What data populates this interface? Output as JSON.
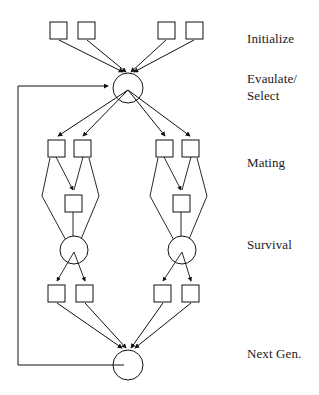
{
  "diagram": {
    "type": "flow-diagram",
    "background_color": "#ffffff",
    "stroke_color": "#111111",
    "node_fill": "#ffffff",
    "stage_labels": [
      {
        "id": "initialize",
        "text": "Initialize",
        "x": 247,
        "y": 30
      },
      {
        "id": "evaluate-select",
        "text": "Evaulate/",
        "x": 247,
        "y": 77
      },
      {
        "id": "evaluate-select-line2",
        "text": "Select",
        "x": 247,
        "y": 94
      },
      {
        "id": "mating",
        "text": "Mating",
        "x": 247,
        "y": 161
      },
      {
        "id": "survival",
        "text": "Survival",
        "x": 247,
        "y": 243
      },
      {
        "id": "next-gen",
        "text": "Next Gen.",
        "x": 247,
        "y": 352
      }
    ],
    "nodes": {
      "initialize_squares": [
        {
          "id": "init-1",
          "x": 50,
          "y": 22,
          "w": 17,
          "h": 17
        },
        {
          "id": "init-2",
          "x": 78,
          "y": 22,
          "w": 17,
          "h": 17
        },
        {
          "id": "init-3",
          "x": 158,
          "y": 22,
          "w": 17,
          "h": 17
        },
        {
          "id": "init-4",
          "x": 186,
          "y": 22,
          "w": 17,
          "h": 17
        }
      ],
      "evaluate_circle": {
        "id": "evaluate-select-node",
        "cx": 128,
        "cy": 88,
        "r": 15
      },
      "mating_squares": [
        {
          "id": "mate-1",
          "x": 48,
          "y": 140,
          "w": 17,
          "h": 17
        },
        {
          "id": "mate-2",
          "x": 74,
          "y": 140,
          "w": 17,
          "h": 17
        },
        {
          "id": "mate-3",
          "x": 156,
          "y": 140,
          "w": 17,
          "h": 17
        },
        {
          "id": "mate-4",
          "x": 182,
          "y": 140,
          "w": 17,
          "h": 17
        }
      ],
      "offspring_squares": [
        {
          "id": "offspring-left",
          "x": 65,
          "y": 195,
          "w": 17,
          "h": 17
        },
        {
          "id": "offspring-right",
          "x": 173,
          "y": 195,
          "w": 17,
          "h": 17
        }
      ],
      "survival_circles": [
        {
          "id": "survival-left",
          "cx": 74,
          "cy": 250,
          "r": 14
        },
        {
          "id": "survival-right",
          "cx": 182,
          "cy": 250,
          "r": 14
        }
      ],
      "survivor_squares": [
        {
          "id": "surv-1",
          "x": 48,
          "y": 285,
          "w": 17,
          "h": 17
        },
        {
          "id": "surv-2",
          "x": 76,
          "y": 285,
          "w": 17,
          "h": 17
        },
        {
          "id": "surv-3",
          "x": 154,
          "y": 285,
          "w": 17,
          "h": 17
        },
        {
          "id": "surv-4",
          "x": 182,
          "y": 285,
          "w": 17,
          "h": 17
        }
      ],
      "next_gen_circle": {
        "id": "next-gen-node",
        "cx": 128,
        "cy": 365,
        "r": 15
      }
    },
    "feedback_loop": {
      "id": "feedback-loop",
      "from": "next-gen-node",
      "to": "evaluate-select-node",
      "path": "M 113 365 L 18 365 L 18 86 L 110 86"
    }
  }
}
